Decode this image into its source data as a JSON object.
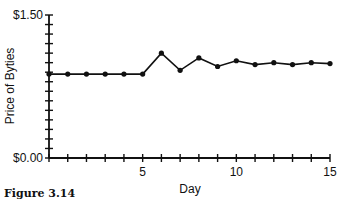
{
  "chart_data": {
    "type": "line",
    "title": "",
    "xlabel": "Day",
    "ylabel": "Price of Byties",
    "x": [
      0,
      1,
      2,
      3,
      4,
      5,
      6,
      7,
      8,
      9,
      10,
      11,
      12,
      13,
      14,
      15
    ],
    "series": [
      {
        "name": "Price of Byties",
        "values": [
          0.88,
          0.88,
          0.88,
          0.88,
          0.88,
          0.88,
          1.1,
          0.92,
          1.05,
          0.96,
          1.02,
          0.98,
          1.0,
          0.98,
          1.0,
          0.99
        ]
      }
    ],
    "xlim": [
      0,
      15
    ],
    "ylim": [
      0,
      1.5
    ],
    "x_tick_labels": [
      "5",
      "10",
      "15"
    ],
    "y_tick_labels": [
      "$0.00",
      "$1.50"
    ],
    "y_minor_tick_step": 0.1,
    "x_minor_tick_step": 1,
    "grid": false,
    "legend": "none"
  },
  "caption": "Figure 3.14",
  "colors": {
    "line": "#111111",
    "axis": "#111111"
  }
}
